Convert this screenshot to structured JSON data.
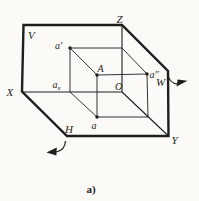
{
  "figure": {
    "caption": "a)",
    "planes": {
      "v": "V",
      "h": "H",
      "w": "W"
    },
    "axes": {
      "x": "X",
      "y": "Y",
      "z": "Z",
      "origin": "O"
    },
    "points": {
      "space_point": "A",
      "frontal": "a′",
      "horizontal": "a",
      "profile": "a″",
      "on_x_axis_base": "a",
      "on_x_axis_sub": "x"
    },
    "colors": {
      "ink": "#1e1e1e",
      "paper": "#fbfaf7"
    }
  }
}
